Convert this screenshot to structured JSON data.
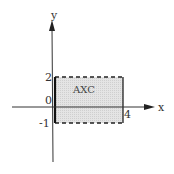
{
  "diagram": {
    "type": "cartesian-region",
    "axes": {
      "x_label": "x",
      "y_label": "y",
      "origin_label": "0"
    },
    "ticks": {
      "y_top": "2",
      "y_bottom": "-1",
      "x_right": "4"
    },
    "region": {
      "label": "AXC",
      "x_range": [
        0,
        4
      ],
      "y_range": [
        -1,
        2
      ]
    },
    "colors": {
      "axis": "#333333",
      "fill": "#e2e2e2",
      "border": "#222222"
    }
  }
}
